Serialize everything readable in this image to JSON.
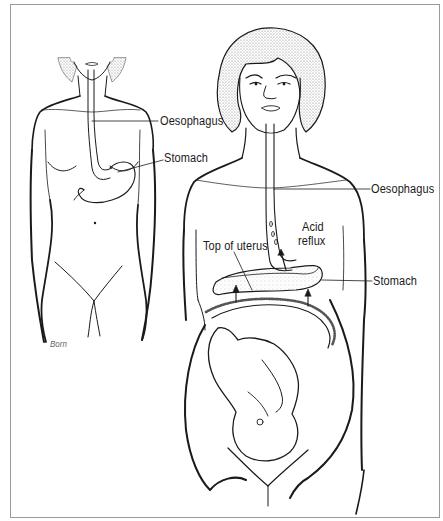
{
  "figure": {
    "left_figure": {
      "description": "non-pregnant woman",
      "labels": {
        "oesophagus": "Oesophagus",
        "stomach": "Stomach"
      },
      "signature": "Born"
    },
    "right_figure": {
      "description": "pregnant woman with fetus",
      "labels": {
        "oesophagus": "Oesophagus",
        "acid_reflux_line1": "Acid",
        "acid_reflux_line2": "reflux",
        "stomach": "Stomach",
        "top_of_uterus": "Top of uterus"
      }
    }
  },
  "colors": {
    "line": "#1a1a1a",
    "frame": "#9a9a9a",
    "hair_stipple": "#8a8a8a",
    "background": "#ffffff"
  }
}
